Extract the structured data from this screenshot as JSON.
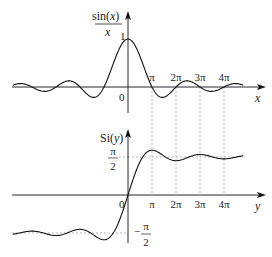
{
  "diagram": {
    "top_plot": {
      "function": "sin(x)/x",
      "ylabel_num": "sin(",
      "ylabel_var": "x",
      "ylabel_close": ")",
      "ylabel_den": "x",
      "xlabel": "x",
      "origin_label": "0",
      "peak_label": "1",
      "x_range_pi": [
        -4.8,
        4.8
      ],
      "tick_labels": [
        "π",
        "2π",
        "3π",
        "4π"
      ],
      "tick_values_pi": [
        1,
        2,
        3,
        4
      ]
    },
    "bottom_plot": {
      "function": "Si(y)",
      "ylabel_prefix": "Si(",
      "ylabel_var": "y",
      "ylabel_close": ")",
      "xlabel": "y",
      "origin_label": "0",
      "upper_asymptote_num": "π",
      "upper_asymptote_den": "2",
      "lower_asymptote_num": "π",
      "lower_asymptote_den": "2",
      "lower_asymptote_sign": "−",
      "x_range_pi": [
        -4.8,
        4.8
      ],
      "tick_labels": [
        "π",
        "2π",
        "3π",
        "4π"
      ],
      "tick_values_pi": [
        1,
        2,
        3,
        4
      ]
    },
    "colors": {
      "curve": "#111111",
      "axis": "#111111",
      "dashed": "#888888"
    }
  }
}
